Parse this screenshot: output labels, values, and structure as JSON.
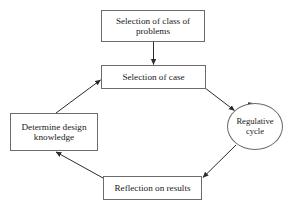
{
  "diagram": {
    "background_color": "#ffffff",
    "stroke_color": "#6b6b6b",
    "arrow_color": "#2b2b2b",
    "text_color": "#1a1a1a",
    "nodes": [
      {
        "id": "class-of-problems",
        "shape": "rectangle",
        "label": "Selection of class of\nproblems"
      },
      {
        "id": "selection-of-case",
        "shape": "rectangle",
        "label": "Selection of case"
      },
      {
        "id": "determine-design-knowledge",
        "shape": "rectangle",
        "label": "Determine design\nknowledge"
      },
      {
        "id": "reflection-on-results",
        "shape": "rectangle",
        "label": "Reflection on results"
      },
      {
        "id": "regulative-cycle",
        "shape": "ellipse",
        "label": "Regulative\ncycle"
      }
    ],
    "edges": [
      {
        "id": "edge-problems-to-case",
        "from": "class-of-problems",
        "to": "selection-of-case",
        "style": "straight-vertical",
        "arrowhead": "to"
      },
      {
        "id": "edge-case-to-cycle",
        "from": "selection-of-case",
        "to": "regulative-cycle",
        "style": "diagonal",
        "arrowhead": "to"
      },
      {
        "id": "edge-cycle-to-reflection",
        "from": "regulative-cycle",
        "to": "reflection-on-results",
        "style": "diagonal",
        "arrowhead": "to"
      },
      {
        "id": "edge-reflection-to-knowledge",
        "from": "reflection-on-results",
        "to": "determine-design-knowledge",
        "style": "diagonal",
        "arrowhead": "to"
      },
      {
        "id": "edge-knowledge-to-case",
        "from": "determine-design-knowledge",
        "to": "selection-of-case",
        "style": "diagonal",
        "arrowhead": "to"
      },
      {
        "id": "edge-cycle-self-loop",
        "from": "regulative-cycle",
        "to": "regulative-cycle",
        "style": "ellipse-top-arrowhead",
        "arrowhead": "clockwise"
      }
    ]
  }
}
